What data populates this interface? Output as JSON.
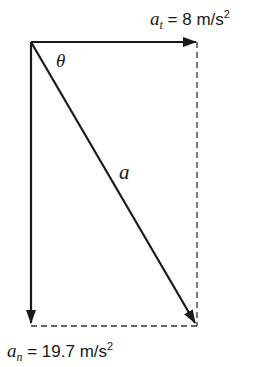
{
  "diagram": {
    "type": "vector-decomposition",
    "vectors": [
      {
        "name": "a_t",
        "symbol": "a",
        "subscript": "t",
        "value": "8",
        "unit": "m/s",
        "unit_exp": "2",
        "direction": "right"
      },
      {
        "name": "a_n",
        "symbol": "a",
        "subscript": "n",
        "value": "19.7",
        "unit": "m/s",
        "unit_exp": "2",
        "direction": "down"
      },
      {
        "name": "a",
        "symbol": "a",
        "direction": "diagonal-down-right"
      }
    ],
    "angle_label": "θ",
    "labels": {
      "at_symbol": "a",
      "at_sub": "t",
      "at_eq": " = 8 m/s",
      "at_exp": "2",
      "an_symbol": "a",
      "an_sub": "n",
      "an_eq": " = 19.7 m/s",
      "an_exp": "2",
      "resultant": "a",
      "theta": "θ"
    },
    "colors": {
      "stroke": "#1a1a1a",
      "background": "#ffffff"
    }
  }
}
